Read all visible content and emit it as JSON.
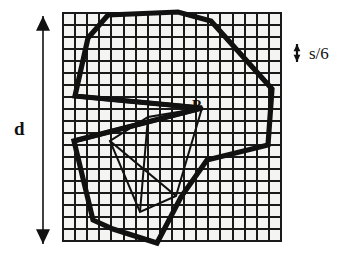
{
  "figure": {
    "background_color": "#ffffff",
    "ink_color": "#111111",
    "grid": {
      "x": 63,
      "y": 13,
      "width": 218,
      "height": 228,
      "cell_size": 12,
      "columns": 18,
      "rows": 19,
      "line_color": "#1a1a1a",
      "line_width": 1.9,
      "border_width": 2.4,
      "fill_color": "#f4f4f2"
    },
    "dimension_d": {
      "label": "d",
      "arrow_x": 43,
      "arrow_top": 16,
      "arrow_bottom": 244,
      "head_size": 7,
      "stroke_width": 1.6
    },
    "dimension_s6": {
      "label": "s/6",
      "arrow_x": 297,
      "arrow_top": 44,
      "arrow_bottom": 62,
      "head_size": 3.4,
      "stroke_width": 2.2
    },
    "point_label": {
      "label": "P",
      "x": 196,
      "y": 107
    },
    "outer_polygon": {
      "name": "thick-outer-polygon",
      "stroke_width": 5.2,
      "points": [
        [
          108,
          15
        ],
        [
          178,
          12
        ],
        [
          211,
          21
        ],
        [
          272,
          89
        ],
        [
          268,
          145
        ],
        [
          207,
          160
        ],
        [
          181,
          197
        ],
        [
          157,
          243
        ],
        [
          113,
          229
        ],
        [
          93,
          220
        ],
        [
          74,
          141
        ],
        [
          202,
          108
        ],
        [
          75,
          96
        ],
        [
          88,
          38
        ]
      ]
    },
    "inner_polygon": {
      "name": "thin-inner-polygon",
      "stroke_width": 2.0,
      "points": [
        [
          202,
          108
        ],
        [
          176,
          196
        ],
        [
          140,
          212
        ],
        [
          110,
          141
        ],
        [
          148,
          117
        ]
      ]
    },
    "extra_strokes": [
      {
        "name": "spike-upper-edge",
        "width": 4.6,
        "points": [
          [
            75,
            96
          ],
          [
            202,
            108
          ]
        ]
      },
      {
        "name": "spike-lower-edge",
        "width": 4.6,
        "points": [
          [
            202,
            108
          ],
          [
            74,
            141
          ]
        ]
      },
      {
        "name": "inner-chord",
        "width": 2.2,
        "points": [
          [
            110,
            141
          ],
          [
            176,
            196
          ]
        ]
      },
      {
        "name": "inner-chord-2",
        "width": 2.0,
        "points": [
          [
            148,
            117
          ],
          [
            140,
            212
          ]
        ]
      }
    ]
  }
}
